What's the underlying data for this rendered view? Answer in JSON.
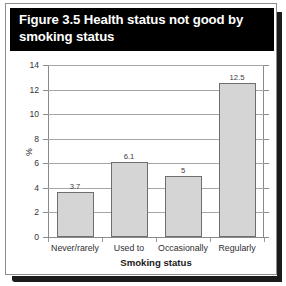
{
  "figure": {
    "title": "Figure 3.5 Health status not good by smoking status"
  },
  "chart_data": {
    "type": "bar",
    "title": "Figure 3.5 Health status not good by smoking status",
    "categories": [
      "Never/rarely",
      "Used to",
      "Occasionally",
      "Regularly"
    ],
    "values": [
      3.7,
      6.1,
      5,
      12.5
    ],
    "value_labels": [
      "3.7",
      "6.1",
      "5",
      "12.5"
    ],
    "xlabel": "Smoking status",
    "ylabel": "%",
    "ylim": [
      0,
      14
    ],
    "ytick_labels": [
      "14",
      "12",
      "10",
      "8",
      "6",
      "4",
      "2",
      "0"
    ],
    "ytick_values": [
      14,
      12,
      10,
      8,
      6,
      4,
      2,
      0
    ],
    "grid": true,
    "legend": false,
    "bar_fill": "#d5d5d5",
    "bar_edge": "#6e6e6e",
    "banner_bg": "#000000",
    "banner_fg": "#ffffff"
  }
}
